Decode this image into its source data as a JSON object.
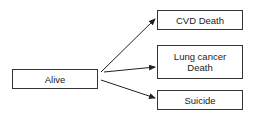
{
  "diagram": {
    "source": {
      "label": "Alive"
    },
    "targets": [
      {
        "label": "CVD Death"
      },
      {
        "label": "Lung cancer\nDeath"
      },
      {
        "label": "Suicide"
      }
    ],
    "edges": [
      {
        "from": "Alive",
        "to": "CVD Death"
      },
      {
        "from": "Alive",
        "to": "Lung cancer Death"
      },
      {
        "from": "Alive",
        "to": "Suicide"
      }
    ]
  }
}
